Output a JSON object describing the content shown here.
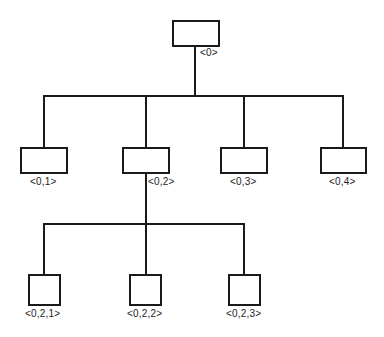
{
  "diagram": {
    "type": "tree",
    "colors": {
      "stroke": "#1a1a1a",
      "background": "#ffffff",
      "label": "#222222"
    },
    "nodes": [
      {
        "id": "root",
        "label": "<0>",
        "box": [
          172,
          20,
          48,
          27
        ],
        "label_pos": [
          200,
          47
        ]
      },
      {
        "id": "n01",
        "label": "<0,1>",
        "box": [
          20,
          147,
          48,
          27
        ],
        "label_pos": [
          30,
          176
        ]
      },
      {
        "id": "n02",
        "label": "<0,2>",
        "box": [
          122,
          147,
          48,
          27
        ],
        "label_pos": [
          148,
          176
        ]
      },
      {
        "id": "n03",
        "label": "<0,3>",
        "box": [
          220,
          147,
          48,
          27
        ],
        "label_pos": [
          230,
          176
        ]
      },
      {
        "id": "n04",
        "label": "<0,4>",
        "box": [
          320,
          147,
          47,
          27
        ],
        "label_pos": [
          329,
          176
        ]
      },
      {
        "id": "n021",
        "label": "<0,2,1>",
        "box": [
          28,
          274,
          33,
          32
        ],
        "label_pos": [
          25,
          308
        ]
      },
      {
        "id": "n022",
        "label": "<0,2,2>",
        "box": [
          129,
          274,
          33,
          32
        ],
        "label_pos": [
          127,
          308
        ]
      },
      {
        "id": "n023",
        "label": "<0,2,3>",
        "box": [
          228,
          274,
          33,
          32
        ],
        "label_pos": [
          226,
          308
        ]
      }
    ],
    "edges": [
      {
        "from": "root",
        "to": "n01"
      },
      {
        "from": "root",
        "to": "n02"
      },
      {
        "from": "root",
        "to": "n03"
      },
      {
        "from": "root",
        "to": "n04"
      },
      {
        "from": "n02",
        "to": "n021"
      },
      {
        "from": "n02",
        "to": "n022"
      },
      {
        "from": "n02",
        "to": "n023"
      }
    ],
    "lines": [
      {
        "name": "root-stem",
        "x": 194,
        "y": 46,
        "w": 2,
        "h": 50
      },
      {
        "name": "level1-bus",
        "x": 43,
        "y": 95,
        "w": 301,
        "h": 2
      },
      {
        "name": "drop-n01",
        "x": 43,
        "y": 95,
        "w": 2,
        "h": 53
      },
      {
        "name": "drop-n02",
        "x": 145,
        "y": 95,
        "w": 2,
        "h": 53
      },
      {
        "name": "drop-n03",
        "x": 243,
        "y": 95,
        "w": 2,
        "h": 53
      },
      {
        "name": "drop-n04",
        "x": 342,
        "y": 95,
        "w": 2,
        "h": 53
      },
      {
        "name": "n02-stem",
        "x": 145,
        "y": 173,
        "w": 2,
        "h": 52
      },
      {
        "name": "level2-bus",
        "x": 43,
        "y": 223,
        "w": 202,
        "h": 2
      },
      {
        "name": "drop-n021",
        "x": 43,
        "y": 223,
        "w": 2,
        "h": 52
      },
      {
        "name": "drop-n022",
        "x": 145,
        "y": 223,
        "w": 2,
        "h": 52
      },
      {
        "name": "drop-n023",
        "x": 243,
        "y": 223,
        "w": 2,
        "h": 52
      }
    ]
  }
}
